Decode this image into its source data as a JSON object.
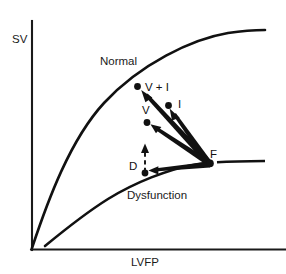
{
  "figure": {
    "name": "frank-starling-ventricular-function-curves",
    "background_color": "#ffffff",
    "ink_color": "#111111"
  },
  "axes": {
    "y_label": "SV",
    "x_label": "LVFP",
    "y_axis_name": "stroke-volume-axis",
    "x_axis_name": "lv-filling-pressure-axis",
    "origin": [
      31,
      250
    ],
    "x_axis_end": [
      284,
      250
    ],
    "y_axis_end": [
      31,
      21
    ]
  },
  "curves": [
    {
      "name": "normal-curve",
      "label": "Normal",
      "label_pos": [
        100,
        65
      ],
      "path": "M 32,248 C 48,200 70,140 104,103 C 140,64 192,39 228,33 C 244,30.6 256,30 265,30",
      "start": [
        32,
        248
      ],
      "end": [
        265,
        30
      ]
    },
    {
      "name": "dysfunction-curve",
      "label": "Dysfunction",
      "label_pos": [
        127,
        199
      ],
      "path": "M 45,246 C 62,232 84,214 108,199 C 134,183 168,169 197,164.2 C 203,163.3 207,163 210,162.8",
      "tail_path": "M 217,162.2 C 230,161.6 250,161.2 265,161",
      "start": [
        45,
        246
      ],
      "end": [
        265,
        161
      ]
    }
  ],
  "points": [
    {
      "name": "point-v-plus-i",
      "label": "V + I",
      "dot": [
        137.5,
        86.5
      ],
      "label_pos": [
        145,
        90.5
      ],
      "dot_radius": 3.4
    },
    {
      "name": "point-i",
      "label": "I",
      "dot": [
        168.5,
        105.5
      ],
      "label_pos": [
        178,
        107.5
      ],
      "dot_radius": 3.4
    },
    {
      "name": "point-v",
      "label": "V",
      "dot": [
        147,
        122.5
      ],
      "label_pos": [
        142,
        114
      ],
      "dot_radius": 3.4
    },
    {
      "name": "point-d",
      "label": "D",
      "dot": [
        145,
        173
      ],
      "label_pos": [
        129,
        170
      ],
      "dot_radius": 3.4
    },
    {
      "name": "point-f",
      "label": "F",
      "dot": [
        210,
        163
      ],
      "label_pos": [
        210,
        158
      ],
      "dot_radius": 3.8
    }
  ],
  "arrows": [
    {
      "name": "arrow-f-to-v-plus-i",
      "from": "F",
      "to": "V + I",
      "style": "solid-tapered",
      "tail": [
        209,
        163
      ],
      "head": [
        141.5,
        91.5
      ]
    },
    {
      "name": "arrow-f-to-i",
      "from": "F",
      "to": "I",
      "style": "solid-tapered",
      "tail": [
        209,
        163
      ],
      "head": [
        170,
        110
      ]
    },
    {
      "name": "arrow-f-to-v",
      "from": "F",
      "to": "V",
      "style": "solid-tapered",
      "tail": [
        209,
        163
      ],
      "head": [
        151,
        125
      ]
    },
    {
      "name": "arrow-f-to-d",
      "from": "F",
      "to": "D",
      "style": "solid-tapered",
      "tail": [
        209,
        165
      ],
      "head": [
        149,
        170.5
      ]
    },
    {
      "name": "arrow-d-upward-dashed",
      "from": "D",
      "to": "upward",
      "style": "dashed",
      "tail": [
        145,
        172
      ],
      "head": [
        145,
        144
      ]
    }
  ]
}
